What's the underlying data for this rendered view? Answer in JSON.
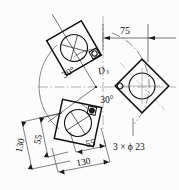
{
  "drawing": {
    "title": "Three-plate 30-degree flange arrangement detail",
    "background_color": "#fcfcfc",
    "line_color": "#121212",
    "thin_line_color": "#555555",
    "center_mark_color": "#777777"
  },
  "labels": {
    "angle_upper": "30°",
    "angle_lower": "30°",
    "center_diameter": "D₃",
    "hole_callout": "3 × ϕ 23"
  },
  "dimensions": {
    "top_right_horizontal": "75",
    "left_outer_vertical": "130",
    "left_inner_vertical": "55",
    "bottom_inner_horizontal": "55",
    "bottom_outer_horizontal": "130"
  },
  "plates": [
    {
      "name": "plate-upper-left",
      "rotation_deg": -30,
      "cx": 74,
      "cy": 48
    },
    {
      "name": "plate-right",
      "rotation_deg": 45,
      "cx": 142,
      "cy": 86
    },
    {
      "name": "plate-lower-left",
      "rotation_deg": 12,
      "cx": 78,
      "cy": 123
    }
  ],
  "geometry": {
    "center_x": 96,
    "center_y": 87,
    "arc_radius": 56,
    "bolt_hole_diameter_note": "23"
  }
}
